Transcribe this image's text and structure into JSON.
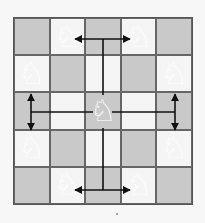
{
  "diagram": {
    "rows": 5,
    "cols": 5,
    "colors": {
      "dark": "#c9c9c9",
      "light": "#f5f5f5",
      "line": "#222222"
    },
    "squares": [
      [
        "dark",
        "light",
        "dark",
        "light",
        "dark"
      ],
      [
        "light",
        "dark",
        "light",
        "dark",
        "light"
      ],
      [
        "dark",
        "light",
        "dark",
        "light",
        "dark"
      ],
      [
        "light",
        "dark",
        "light",
        "dark",
        "light"
      ],
      [
        "dark",
        "light",
        "dark",
        "light",
        "dark"
      ]
    ],
    "pieces": [
      {
        "row": 0,
        "col": 1,
        "glyph": "♘",
        "name": "white-knight"
      },
      {
        "row": 0,
        "col": 3,
        "glyph": "♘",
        "name": "white-knight"
      },
      {
        "row": 1,
        "col": 0,
        "glyph": "♘",
        "name": "white-knight"
      },
      {
        "row": 1,
        "col": 4,
        "glyph": "♘",
        "name": "white-knight"
      },
      {
        "row": 2,
        "col": 2,
        "glyph": "♘",
        "name": "white-knight"
      },
      {
        "row": 3,
        "col": 0,
        "glyph": "♘",
        "name": "white-knight"
      },
      {
        "row": 3,
        "col": 4,
        "glyph": "♘",
        "name": "white-knight"
      },
      {
        "row": 4,
        "col": 1,
        "glyph": "♘",
        "name": "white-knight"
      },
      {
        "row": 4,
        "col": 3,
        "glyph": "♘",
        "name": "white-knight"
      }
    ]
  }
}
